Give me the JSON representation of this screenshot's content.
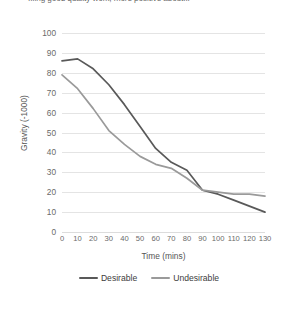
{
  "caption": {
    "text": "...ing good quality work, more positive about..."
  },
  "colors": {
    "desirable": "#595959",
    "undesirable": "#9a9a9a",
    "grid": "#e4e4e4",
    "tick_text": "#6a6a6a",
    "axis_title": "#555555",
    "background": "#ffffff"
  },
  "legend": {
    "position": "bottom",
    "items": [
      {
        "label": "Desirable",
        "color": "#595959"
      },
      {
        "label": "Undesirable",
        "color": "#9a9a9a"
      }
    ]
  },
  "axes": {
    "x_title": "Time (mins)",
    "y_title": "Gravity (-1000)",
    "y_ticks": [
      "100",
      "90",
      "80",
      "70",
      "60",
      "50",
      "40",
      "30",
      "20",
      "10",
      "0"
    ],
    "x_ticks": [
      "0",
      "10",
      "20",
      "30",
      "40",
      "50",
      "60",
      "70",
      "80",
      "90",
      "100",
      "110",
      "120",
      "130"
    ]
  },
  "chart_data": {
    "type": "line",
    "title": "",
    "xlabel": "Time (mins)",
    "ylabel": "Gravity (-1000)",
    "xlim": [
      0,
      130
    ],
    "ylim": [
      0,
      100
    ],
    "grid": true,
    "legend_position": "bottom",
    "x": [
      0,
      10,
      20,
      30,
      40,
      50,
      60,
      70,
      80,
      90,
      100,
      110,
      120,
      130
    ],
    "series": [
      {
        "name": "Desirable",
        "color": "#595959",
        "values": [
          86,
          87,
          82,
          74,
          64,
          53,
          42,
          35,
          31,
          21,
          19,
          16,
          13,
          10
        ]
      },
      {
        "name": "Undesirable",
        "color": "#9a9a9a",
        "values": [
          79,
          72,
          62,
          51,
          44,
          38,
          34,
          32,
          27,
          21,
          20,
          19,
          19,
          18
        ]
      }
    ]
  }
}
